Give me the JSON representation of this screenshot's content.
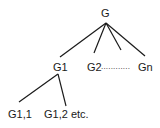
{
  "diagram": {
    "type": "tree",
    "root": {
      "label": "G"
    },
    "level1": [
      {
        "label": "G1"
      },
      {
        "label": "G2"
      },
      {
        "label": "............"
      },
      {
        "label": "Gn"
      }
    ],
    "level2": [
      {
        "label": "G1,1"
      },
      {
        "label": "G1,2 etc."
      }
    ],
    "edges": [
      [
        "G",
        "G1"
      ],
      [
        "G",
        "G2"
      ],
      [
        "G",
        "..."
      ],
      [
        "G",
        "Gn"
      ],
      [
        "G1",
        "G1,1"
      ],
      [
        "G1",
        "G1,2 etc."
      ]
    ],
    "colors": {
      "line": "#1a1a1a",
      "text": "#1a1a1a",
      "background": "#ffffff"
    }
  }
}
